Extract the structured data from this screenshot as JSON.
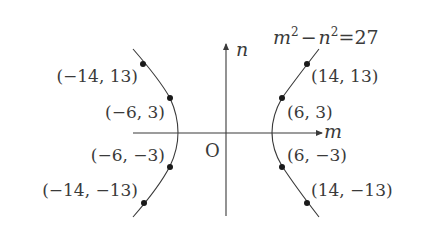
{
  "diagram": {
    "equation": {
      "lhs_a": "m",
      "lhs_b": "n",
      "exp": "2",
      "minus": "−",
      "equals": "=",
      "rhs": "27"
    },
    "axes": {
      "x_label": "m",
      "y_label": "n",
      "origin_label": "O"
    },
    "points": [
      {
        "label": "(−14, 13)",
        "m": -14,
        "n": 13
      },
      {
        "label": "(−6, 3)",
        "m": -6,
        "n": 3
      },
      {
        "label": "(−6, −3)",
        "m": -6,
        "n": -3
      },
      {
        "label": "(−14, −13)",
        "m": -14,
        "n": -13
      },
      {
        "label": "(14, 13)",
        "m": 14,
        "n": 13
      },
      {
        "label": "(6, 3)",
        "m": 6,
        "n": 3
      },
      {
        "label": "(6, −3)",
        "m": 6,
        "n": -3
      },
      {
        "label": "(14, −13)",
        "m": 14,
        "n": -13
      }
    ],
    "colors": {
      "ink": "#3a3a3a",
      "point": "#1a1a1a"
    }
  }
}
